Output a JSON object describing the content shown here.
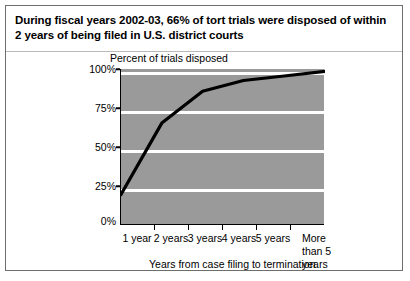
{
  "figure": {
    "title": "During fiscal years 2002-03, 66% of tort trials were disposed of within 2 years of being filed in U.S. district courts",
    "plot_fill_color": "#9a9a9a",
    "line_color": "#000000",
    "gridline_color": "#ffffff",
    "border_color": "#6e6e6e"
  },
  "chart_data": {
    "type": "line",
    "title": "During fiscal years 2002-03, 66% of tort trials were disposed of within 2 years of being filed in U.S. district courts",
    "xlabel": "Years from case filing to termination",
    "ylabel": "Percent of trials disposed",
    "categories": [
      "1 year",
      "2 years",
      "3 years",
      "4 years",
      "5 years",
      "More than 5 years"
    ],
    "values": [
      19,
      66,
      87,
      94,
      97,
      100
    ],
    "ytick_labels": [
      "0%",
      "25%",
      "50%",
      "75%",
      "100%"
    ],
    "ytick_values": [
      0,
      25,
      50,
      75,
      100
    ],
    "ylim": [
      0,
      100
    ],
    "grid": true,
    "legend": "none"
  }
}
